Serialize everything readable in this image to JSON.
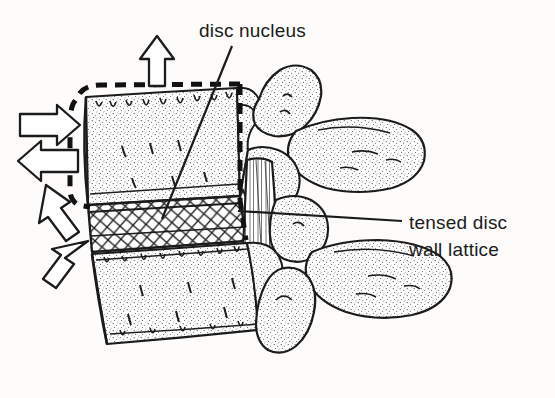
{
  "figure": {
    "type": "anatomical-line-illustration",
    "background_color": "#fdfcfa",
    "ink_color": "#1b1b1b",
    "labels": {
      "disc_nucleus": "disc nucleus",
      "tensed_lattice_line1": "tensed disc",
      "tensed_lattice_line2": "wall lattice"
    },
    "annotations": {
      "leader_lines": [
        {
          "name": "disc-nucleus-leader",
          "from_x": 232,
          "from_y": 46,
          "to_x": 162,
          "to_y": 219
        },
        {
          "name": "tensed-lattice-leader",
          "from_x": 402,
          "from_y": 222,
          "to_x": 238,
          "to_y": 211
        }
      ],
      "arrows": [
        {
          "name": "arrow-up",
          "direction": "up",
          "x": 157,
          "y": 62
        },
        {
          "name": "arrow-right",
          "direction": "right",
          "x": 46,
          "y": 125
        },
        {
          "name": "arrow-left",
          "direction": "left",
          "x": 44,
          "y": 160
        },
        {
          "name": "arrow-up-left",
          "direction": "up-left",
          "x": 58,
          "y": 205
        },
        {
          "name": "arrow-down-left",
          "direction": "down-left",
          "x": 72,
          "y": 255
        }
      ],
      "dashed_outline": {
        "name": "expanded-vertebral-body-outline",
        "description": "dashed contour around superior vertebral body indicating expansion"
      }
    }
  }
}
